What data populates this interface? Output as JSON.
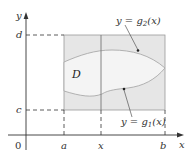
{
  "diagram": {
    "colors": {
      "axis": "#333333",
      "rect_fill": "#e6e6e6",
      "rect_stroke": "#9a9a9a",
      "region_fill": "#f2f2f2",
      "curve": "#a9a9a9",
      "dash": "#333333"
    },
    "axes": {
      "x_label": "x",
      "y_label": "y",
      "origin_label": "0"
    },
    "x_ticks": [
      {
        "label": "a"
      },
      {
        "label": "x"
      },
      {
        "label": "b"
      }
    ],
    "y_ticks": [
      {
        "label": "d"
      },
      {
        "label": "c"
      }
    ],
    "region_label": "D",
    "curves": {
      "upper": {
        "prefix": "y = g",
        "sub": "2",
        "suffix": "(x)"
      },
      "lower": {
        "prefix": "y = g",
        "sub": "1",
        "suffix": "(x)"
      }
    }
  }
}
